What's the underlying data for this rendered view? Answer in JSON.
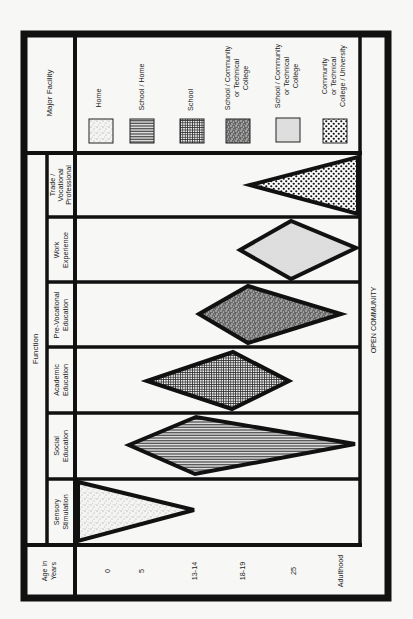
{
  "diagram": {
    "orientation": "rotated-90-ccw",
    "header": {
      "major_facility": "Major Facility",
      "function": "Function",
      "age_in_years": [
        "Age in",
        "Years"
      ],
      "open_community": "OPEN COMMUNITY"
    },
    "legend": [
      {
        "pattern": "sparse-stipple",
        "label": [
          "Home"
        ]
      },
      {
        "pattern": "horizontal-lines",
        "label": [
          "School / Home"
        ]
      },
      {
        "pattern": "grid",
        "label": [
          "School"
        ]
      },
      {
        "pattern": "dense-speckle",
        "label": [
          "School / Community",
          "or Technical",
          "College"
        ]
      },
      {
        "pattern": "fine-dots",
        "label": [
          "School / Community",
          "or Technical",
          "College"
        ]
      },
      {
        "pattern": "large-dots",
        "label": [
          "Community",
          "or Technical",
          "College / University"
        ]
      }
    ],
    "functions": [
      {
        "label": [
          "Trade /",
          "Vocational",
          "Professional"
        ],
        "pattern": "large-dots",
        "shape": "triangle",
        "span": "18-19 to Adulthood"
      },
      {
        "label": [
          "Work",
          "Experience"
        ],
        "pattern": "fine-dots",
        "shape": "diamond",
        "span": "18-19 to Adulthood"
      },
      {
        "label": [
          "Pre-Vocational",
          "Education"
        ],
        "pattern": "dense-speckle",
        "shape": "diamond",
        "span": "13-14 to 25"
      },
      {
        "label": [
          "Academic",
          "Education"
        ],
        "pattern": "grid",
        "shape": "diamond",
        "span": "5 to 18-19"
      },
      {
        "label": [
          "Social",
          "Education"
        ],
        "pattern": "horizontal-lines",
        "shape": "diamond",
        "span": "5 to Adulthood"
      },
      {
        "label": [
          "Sensory",
          "Stimulation"
        ],
        "pattern": "sparse-stipple",
        "shape": "triangle",
        "span": "0 to 13-14"
      }
    ],
    "ages": [
      "0",
      "5",
      "13-14",
      "18-19",
      "25",
      "Adulthood"
    ]
  },
  "colors": {
    "line": "#111111",
    "paper": "#f7f7f5"
  }
}
